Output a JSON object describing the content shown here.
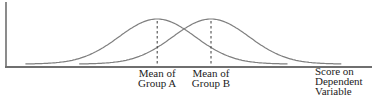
{
  "figure": {
    "background": "#ffffff",
    "labels": {
      "mean_a": "Mean of\nGroup A",
      "mean_b": "Mean of\nGroup B",
      "x_axis": "Score on\nDependent\nVariable"
    },
    "colors": {
      "curve": "#7f7f7f",
      "axis": "#6f6f6f",
      "mean_line": "#3a3a3a",
      "text": "#1c1c1c"
    }
  },
  "chart_data": {
    "type": "line",
    "subtype": "overlapping-normal-distributions",
    "title": "",
    "xlabel": "Score on Dependent Variable",
    "ylabel": "",
    "grid": false,
    "legend": false,
    "x_axis": {
      "min": 0,
      "max": 100,
      "ticks": [],
      "visible_scale": false
    },
    "y_axis": {
      "min": 0,
      "max": 1.1,
      "ticks": [],
      "visible_scale": false
    },
    "series": [
      {
        "name": "Group A",
        "distribution": "normal",
        "mean": 41.3,
        "sd": 10.4,
        "peak": 1.0,
        "x_range": [
          5.3,
          77.3
        ]
      },
      {
        "name": "Group B",
        "distribution": "normal",
        "mean": 56.0,
        "sd": 10.4,
        "peak": 1.0,
        "x_range": [
          20.0,
          92.0
        ]
      }
    ],
    "annotations": [
      {
        "label": "Mean of Group A",
        "x": 41.3,
        "style": "dashed-vertical-line"
      },
      {
        "label": "Mean of Group B",
        "x": 56.0,
        "style": "dashed-vertical-line"
      }
    ]
  }
}
